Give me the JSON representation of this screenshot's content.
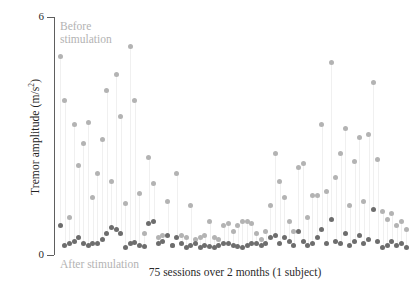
{
  "chart_data": {
    "type": "scatter",
    "title": "",
    "xlabel": "75 sessions over 2 months (1 subject)",
    "ylabel": "Tremor amplitude (m/s²)",
    "ylim": [
      0,
      6
    ],
    "yticks": [
      0,
      6
    ],
    "ytick_labels": [
      "0",
      "6"
    ],
    "xlim": [
      1,
      75
    ],
    "grid": false,
    "legend_position": "inline-annotation",
    "annotations": [
      {
        "name": "before-stimulation-label",
        "text": "Before\nstimulation",
        "color": "#b3b3b3"
      },
      {
        "name": "after-stimulation-label",
        "text": "After stimulation",
        "color": "#b3b3b3"
      }
    ],
    "colors": {
      "before": "#b3b3b3",
      "after": "#6d6d6d",
      "stem": "#f0f0f0",
      "axis": "#5e5e5e"
    },
    "x": [
      1,
      2,
      3,
      4,
      5,
      6,
      7,
      8,
      9,
      10,
      11,
      12,
      13,
      14,
      15,
      16,
      17,
      18,
      19,
      20,
      21,
      22,
      23,
      24,
      25,
      26,
      27,
      28,
      29,
      30,
      31,
      32,
      33,
      34,
      35,
      36,
      37,
      38,
      39,
      40,
      41,
      42,
      43,
      44,
      45,
      46,
      47,
      48,
      49,
      50,
      51,
      52,
      53,
      54,
      55,
      56,
      57,
      58,
      59,
      60,
      61,
      62,
      63,
      64,
      65,
      66,
      67,
      68,
      69,
      70,
      71,
      72,
      73,
      74,
      75
    ],
    "series": [
      {
        "name": "Before stimulation",
        "color": "#b3b3b3",
        "values": [
          5.0,
          3.9,
          0.95,
          3.3,
          2.25,
          2.8,
          3.35,
          1.45,
          2.05,
          2.9,
          4.15,
          1.85,
          4.55,
          3.5,
          1.3,
          5.25,
          3.9,
          1.55,
          0.55,
          2.45,
          1.8,
          0.45,
          0.5,
          1.35,
          0.25,
          2.05,
          0.5,
          0.45,
          1.25,
          0.4,
          0.45,
          0.5,
          0.85,
          0.45,
          0.4,
          0.75,
          0.8,
          0.6,
          0.75,
          0.85,
          0.85,
          0.8,
          0.55,
          0.4,
          0.6,
          1.25,
          2.55,
          1.85,
          1.45,
          0.85,
          0.6,
          2.2,
          2.3,
          0.95,
          1.5,
          1.5,
          3.3,
          1.6,
          4.85,
          1.95,
          2.55,
          3.2,
          1.25,
          2.35,
          2.95,
          1.35,
          3.05,
          4.35,
          2.4,
          1.1,
          0.9,
          1.05,
          0.75,
          0.85,
          0.65
        ]
      },
      {
        "name": "After stimulation",
        "color": "#6d6d6d",
        "values": [
          0.75,
          0.25,
          0.28,
          0.35,
          0.45,
          0.3,
          0.25,
          0.3,
          0.3,
          0.4,
          0.55,
          0.7,
          0.65,
          0.55,
          0.2,
          0.3,
          0.32,
          0.25,
          0.22,
          0.8,
          0.85,
          0.3,
          0.35,
          0.5,
          0.25,
          0.45,
          0.3,
          0.2,
          0.25,
          0.3,
          0.2,
          0.25,
          0.22,
          0.2,
          0.25,
          0.28,
          0.3,
          0.25,
          0.22,
          0.2,
          0.25,
          0.3,
          0.28,
          0.25,
          0.3,
          0.45,
          0.5,
          0.3,
          0.45,
          0.35,
          0.25,
          0.6,
          0.35,
          0.25,
          0.3,
          0.45,
          0.65,
          0.3,
          0.9,
          0.35,
          0.3,
          0.55,
          0.25,
          0.35,
          0.5,
          0.3,
          0.4,
          1.15,
          0.35,
          0.2,
          0.25,
          0.35,
          0.25,
          0.3,
          0.2
        ]
      }
    ]
  },
  "axis": {
    "ytick_top": "6",
    "ytick_bottom": "0",
    "ylabel_text": "Tremor amplitude (m/s",
    "ylabel_sup": "2",
    "ylabel_close": ")",
    "xcaption": "75 sessions over 2 months (1 subject)"
  },
  "labels": {
    "before": "Before\nstimulation",
    "after": "After stimulation"
  }
}
